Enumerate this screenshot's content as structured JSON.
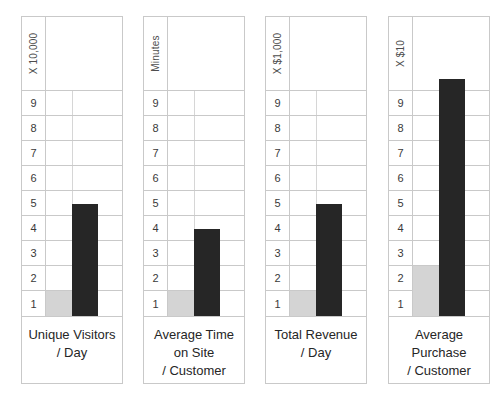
{
  "chart_data": [
    {
      "type": "bar",
      "title": "Unique Visitors / Day",
      "caption_lines": [
        "Unique Visitors",
        "/ Day"
      ],
      "ylabel": "X 10,000",
      "ylim": [
        0,
        10
      ],
      "yticks": [
        "9",
        "8",
        "7",
        "6",
        "5",
        "4",
        "3",
        "2",
        "1"
      ],
      "grid": true,
      "categories": [
        "before",
        "after"
      ],
      "series": [
        {
          "name": "before",
          "values": [
            1
          ],
          "color": "#d4d4d4"
        },
        {
          "name": "after",
          "values": [
            4.5
          ],
          "color": "#262626"
        }
      ],
      "values": [
        1,
        4.5
      ]
    },
    {
      "type": "bar",
      "title": "Average Time on Site / Customer",
      "caption_lines": [
        "Average Time",
        "on Site",
        "/ Customer"
      ],
      "ylabel": "Minutes",
      "ylim": [
        0,
        10
      ],
      "yticks": [
        "9",
        "8",
        "7",
        "6",
        "5",
        "4",
        "3",
        "2",
        "1"
      ],
      "grid": true,
      "categories": [
        "before",
        "after"
      ],
      "series": [
        {
          "name": "before",
          "values": [
            1
          ],
          "color": "#d4d4d4"
        },
        {
          "name": "after",
          "values": [
            3.5
          ],
          "color": "#262626"
        }
      ],
      "values": [
        1,
        3.5
      ]
    },
    {
      "type": "bar",
      "title": "Total Revenue / Day",
      "caption_lines": [
        "Total Revenue",
        "/ Day"
      ],
      "ylabel": "X $1,000",
      "ylim": [
        0,
        10
      ],
      "yticks": [
        "9",
        "8",
        "7",
        "6",
        "5",
        "4",
        "3",
        "2",
        "1"
      ],
      "grid": true,
      "categories": [
        "before",
        "after"
      ],
      "series": [
        {
          "name": "before",
          "values": [
            1
          ],
          "color": "#d4d4d4"
        },
        {
          "name": "after",
          "values": [
            4.5
          ],
          "color": "#262626"
        }
      ],
      "values": [
        1,
        4.5
      ]
    },
    {
      "type": "bar",
      "title": "Average Purchase / Customer",
      "caption_lines": [
        "Average",
        "Purchase",
        "/ Customer"
      ],
      "ylabel": "X $10",
      "ylim": [
        0,
        10
      ],
      "yticks": [
        "9",
        "8",
        "7",
        "6",
        "5",
        "4",
        "3",
        "2",
        "1"
      ],
      "grid": true,
      "categories": [
        "before",
        "after"
      ],
      "series": [
        {
          "name": "before",
          "values": [
            2
          ],
          "color": "#d4d4d4"
        },
        {
          "name": "after",
          "values": [
            9.5
          ],
          "color": "#262626"
        }
      ],
      "values": [
        2,
        9.5
      ]
    }
  ],
  "colors": {
    "bar_light": "#d4d4d4",
    "bar_dark": "#262626",
    "grid_line": "#c9c9c9",
    "background": "#ffffff",
    "text": "#262626"
  }
}
